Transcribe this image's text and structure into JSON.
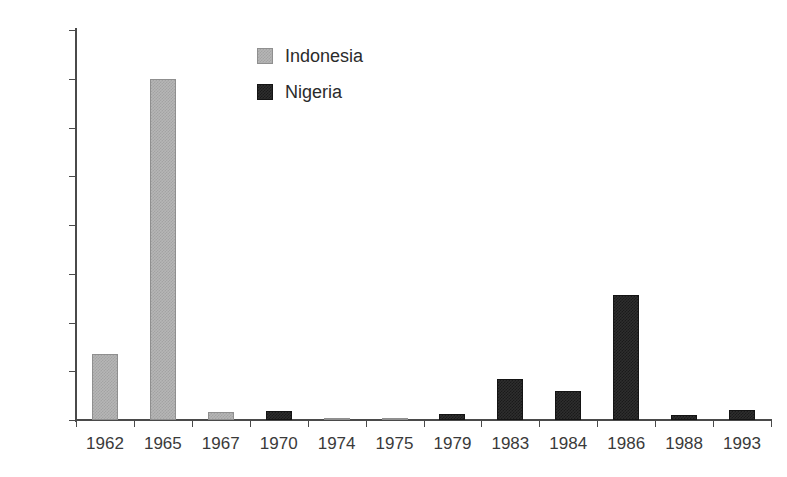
{
  "chart_data": {
    "type": "bar",
    "title": "",
    "subtitle": "",
    "xlabel": "",
    "ylabel": "",
    "categories": [
      "1962",
      "1965",
      "1967",
      "1970",
      "1974",
      "1975",
      "1979",
      "1983",
      "1984",
      "1986",
      "1988",
      "1993"
    ],
    "series": [
      {
        "name": "Indonesia",
        "color": "#b6b6b6",
        "values": [
          680,
          3500,
          80,
          0,
          15,
          10,
          0,
          0,
          0,
          0,
          0,
          0
        ]
      },
      {
        "name": "Nigeria",
        "color": "#2e2e2e",
        "values": [
          0,
          0,
          0,
          90,
          0,
          0,
          60,
          420,
          300,
          1280,
          55,
          100
        ]
      }
    ],
    "ylim": [
      0,
      4000
    ],
    "yticks": [
      0,
      500,
      1000,
      1500,
      2000,
      2500,
      3000,
      3500,
      4000
    ],
    "ytick_labels": [
      "0",
      "500",
      "1,000",
      "1,500",
      "2,000",
      "2,500",
      "3,000",
      "3,500",
      "4,000"
    ],
    "grid": false,
    "legend_position": "top-center",
    "legend": [
      {
        "label": "Indonesia",
        "swatch": "indonesia"
      },
      {
        "label": "Nigeria",
        "swatch": "nigeria"
      }
    ]
  }
}
